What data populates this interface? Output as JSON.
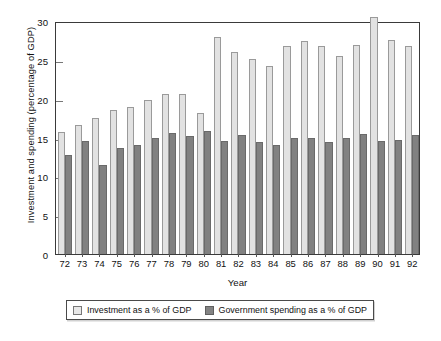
{
  "chart_data": {
    "type": "bar",
    "title": "",
    "xlabel": "Year",
    "ylabel": "Investment and spending (percentage of GDP)",
    "ylim": [
      0,
      30
    ],
    "ytick_labels": [
      "0",
      "5",
      "10",
      "15",
      "20",
      "25",
      "30"
    ],
    "ytick_values": [
      0,
      5,
      10,
      15,
      20,
      25,
      30
    ],
    "grid": false,
    "legend_position": "bottom",
    "categories": [
      "72",
      "73",
      "74",
      "75",
      "76",
      "77",
      "78",
      "79",
      "80",
      "81",
      "82",
      "83",
      "84",
      "85",
      "86",
      "87",
      "88",
      "89",
      "90",
      "91",
      "92"
    ],
    "series": [
      {
        "name": "Investment as a % of GDP",
        "color": "#e2e2e2",
        "values": [
          15.7,
          16.6,
          17.5,
          18.6,
          18.9,
          19.8,
          20.6,
          20.6,
          18.2,
          28.0,
          26.0,
          25.1,
          24.2,
          26.8,
          27.4,
          26.8,
          25.5,
          26.9,
          30.5,
          27.6,
          26.8
        ]
      },
      {
        "name": "Government spending as a % of GDP",
        "color": "#818181",
        "values": [
          12.7,
          14.5,
          11.4,
          13.7,
          14.1,
          14.9,
          15.6,
          15.2,
          15.8,
          14.5,
          15.3,
          14.4,
          14.1,
          15.0,
          15.0,
          14.4,
          15.0,
          15.4,
          14.5,
          14.7,
          15.3
        ]
      }
    ]
  },
  "legend": {
    "items": [
      {
        "label": "Investment as a % of GDP",
        "style": "light"
      },
      {
        "label": "Government spending as a % of GDP",
        "style": "dark"
      }
    ]
  }
}
